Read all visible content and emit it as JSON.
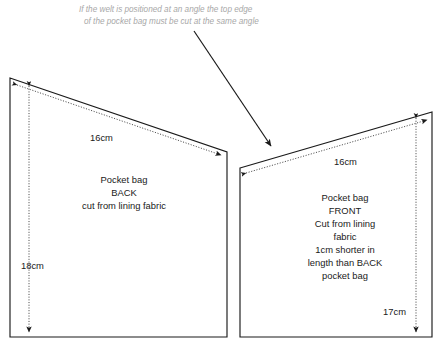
{
  "annotation": {
    "line1": "If the welt is positioned at an angle the top edge",
    "line2": "of the pocket bag must  be cut at the same angle",
    "color": "#a8a8a8"
  },
  "pieces": {
    "back": {
      "labels": [
        "Pocket bag",
        "BACK",
        "cut from lining fabric"
      ],
      "dimensions": {
        "top_edge": "16cm",
        "left_edge": "18cm"
      }
    },
    "front": {
      "labels": [
        "Pocket bag",
        "FRONT",
        "Cut from lining",
        "fabric",
        "1cm shorter in",
        "length than BACK",
        "pocket bag"
      ],
      "dimensions": {
        "top_edge": "16cm",
        "right_edge": "17cm"
      }
    }
  },
  "style": {
    "line_color": "#1a1a1a",
    "background": "#ffffff"
  }
}
